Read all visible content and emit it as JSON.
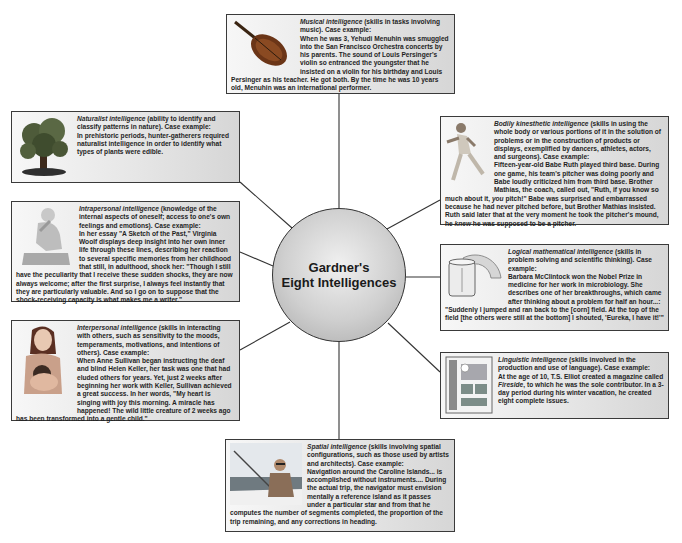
{
  "center": {
    "line1": "Gardner's",
    "line2": "Eight Intelligences"
  },
  "intelligences": {
    "musical": {
      "name": "Musical intelligence",
      "desc": " (skills in tasks involving music). Case example:",
      "example": "When he was 3, Yehudi Menuhin was smuggled into the San Francisco Orchestra concerts by his parents. The sound of Louis Persinger's violin so entranced the youngster that he insisted on a violin for his birthday and Louis Persinger as his teacher. He got both. By the time he was 10 years old, Menuhin was an international performer.",
      "icon": "violin-icon"
    },
    "naturalist": {
      "name": "Naturalist intelligence",
      "desc": " (ability to identify and classify patterns in nature). Case example:",
      "example": "In prehistoric periods, hunter-gatherers required naturalist intelligence in order to identify what types of plants were edible.",
      "icon": "tree-icon"
    },
    "intrapersonal": {
      "name": "Intrapersonal intelligence",
      "desc": " (knowledge of the internal aspects of oneself; access to one's own feelings and emotions). Case example:",
      "example": "In her essay \"A Sketch of the Past,\" Virginia Woolf displays deep insight into her own inner life through these lines, describing her reaction to several specific memories from her childhood that still, in adulthood, shock her: \"Though I still have the peculiarity that I receive these sudden shocks, they are now always welcome; after the first surprise, I always feel instantly that they are particularly valuable. And so I go on to suppose that the shock-receiving capacity is what makes me a writer.\"",
      "icon": "thinker-statue-icon"
    },
    "interpersonal": {
      "name": "Interpersonal intelligence",
      "desc": " (skills in interacting with others, such as sensitivity to the moods, temperaments, motivations, and intentions of others). Case example:",
      "example": "When Anne Sullivan began instructing the deaf and blind Helen Keller, her task was one that had eluded others for years. Yet, just 2 weeks after beginning her work with Keller, Sullivan achieved a great success. In her words, \"My heart is singing with joy this morning. A miracle has happened! The wild little creature of 2 weeks ago has been transformed into a gentle child.\"",
      "icon": "mother-child-icon"
    },
    "bodily": {
      "name": "Bodily kinesthetic intelligence",
      "desc": " (skills in using the whole body or various portions of it in the solution of problems or in the construction of products or displays, exemplified by dancers, athletes, actors, and surgeons). Case example:",
      "example_a": "Fifteen-year-old Babe Ruth played third base. During one game, his team's pitcher was doing poorly and Babe loudly criticized him from third base. Brother Mathias, the coach, called out, \"Ruth, if you know so much about it, ",
      "example_em1": "you",
      "example_b": " pitch!\" Babe was surprised and embarrassed because he had never pitched before, but Brother Mathias insisted. Ruth said later that at the very moment he took the pitcher's mound, he ",
      "example_em2": "knew",
      "example_c": " he was supposed to be a pitcher.",
      "icon": "baseball-pitcher-icon"
    },
    "logical": {
      "name": "Logical mathematical intelligence",
      "desc": " (skills in problem solving and scientific thinking). Case example:",
      "example": "Barbara McClintock won the Nobel Prize in medicine for her work in microbiology. She describes one of her breakthroughs, which came after thinking about a problem for half an hour...: \"Suddenly I jumped and ran back to the [corn] field. At the top of the field [the others were still at the bottom] I shouted, 'Eureka, I have it!'\"",
      "icon": "lab-beaker-icon"
    },
    "linguistic": {
      "name": "Linguistic intelligence",
      "desc": " (skills involved in the production and use of language). Case example:",
      "example_a": "At the age of 10, T.S. Elliot created a magazine called ",
      "example_em": "Fireside",
      "example_b": ", to which he was the sole contributor. In a 3-day period during his winter vacation, he created eight complete issues.",
      "icon": "magazine-page-icon"
    },
    "spatial": {
      "name": "Spatial intelligence",
      "desc": " (skills involving spatial configurations, such as those used by artists and architects). Case example:",
      "example": "Navigation around the Caroline Islands... is accomplished without instruments.... During the actual trip, the navigator must envision mentally a reference island as it passes under a particular star and from that he computes the number of segments completed, the proportion of the trip remaining, and any corrections in heading.",
      "icon": "sailor-navigator-icon"
    }
  }
}
